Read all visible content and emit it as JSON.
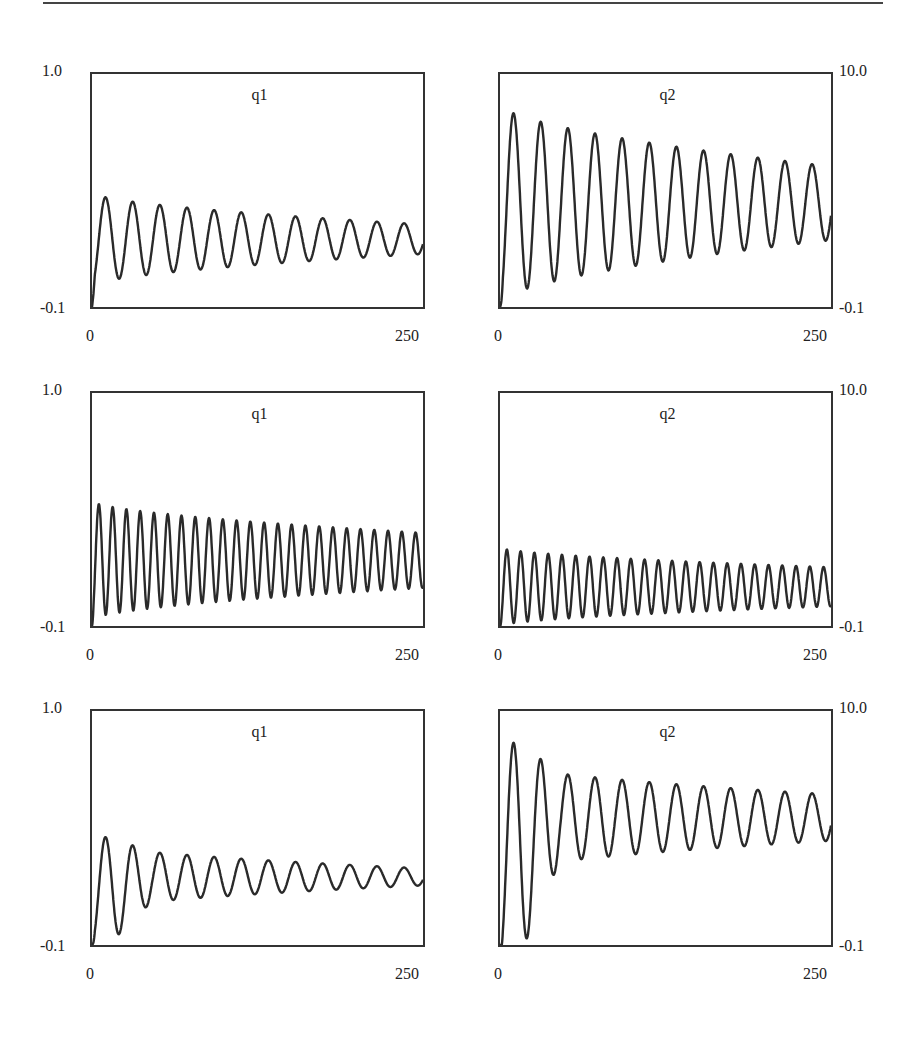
{
  "page": {
    "top_rule": true
  },
  "chart_data": [
    {
      "type": "line",
      "row": 1,
      "col": 1,
      "title": "q1",
      "xlim": [
        0,
        250
      ],
      "ylim": [
        -0.1,
        1.0
      ],
      "x_tick_labels": [
        "0",
        "250"
      ],
      "y_tick_labels": [
        "1.0",
        "-0.1"
      ],
      "y_axis_side": "left",
      "grid": false,
      "legend": null,
      "model": {
        "offset": 0.22,
        "amp0": 0.22,
        "amp_end": 0.07,
        "period": 20.5,
        "start": 0.0
      },
      "peaks": [
        0.26,
        0.24,
        0.23,
        0.22,
        0.21,
        0.2,
        0.19,
        0.18,
        0.17,
        0.17,
        0.16,
        0.15
      ],
      "troughs": [
        -0.03,
        -0.02,
        0.0,
        0.01,
        0.02,
        0.03,
        0.04,
        0.05,
        0.05,
        0.06,
        0.07,
        0.07
      ]
    },
    {
      "type": "line",
      "row": 1,
      "col": 2,
      "title": "q2",
      "xlim": [
        0,
        250
      ],
      "ylim": [
        -0.1,
        10.0
      ],
      "x_tick_labels": [
        "0",
        "250"
      ],
      "y_tick_labels": [
        "10.0",
        "-0.1"
      ],
      "y_axis_side": "right",
      "grid": false,
      "legend": null,
      "model": {
        "offset": 4.4,
        "amp0": 4.3,
        "amp_end": 1.6,
        "period": 20.5,
        "start": 0.0
      },
      "peaks": [
        8.2,
        7.8,
        7.4,
        7.1,
        6.9,
        6.6,
        6.4,
        6.2,
        6.0,
        5.9,
        5.7,
        5.6
      ],
      "troughs": [
        0.3,
        0.7,
        1.2,
        1.6,
        1.8,
        2.2,
        2.5,
        2.8,
        3.0,
        3.3,
        3.6,
        3.9
      ]
    },
    {
      "type": "line",
      "row": 2,
      "col": 1,
      "title": "q1",
      "xlim": [
        0,
        250
      ],
      "ylim": [
        -0.1,
        1.0
      ],
      "x_tick_labels": [
        "0",
        "250"
      ],
      "y_tick_labels": [
        "1.0",
        "-0.1"
      ],
      "y_axis_side": "left",
      "grid": false,
      "legend": null,
      "model": {
        "offset": 0.21,
        "amp0": 0.28,
        "amp_end": 0.13,
        "period": 10.4,
        "start": 0.0
      },
      "peaks": [
        0.45,
        0.49,
        0.45,
        0.4,
        0.42,
        0.44,
        0.42,
        0.37,
        0.35,
        0.36,
        0.38,
        0.36
      ],
      "troughs": [
        -0.03,
        -0.03,
        -0.02,
        -0.02,
        -0.01,
        0.0,
        0.0,
        0.01,
        0.01,
        0.02,
        0.02,
        0.03
      ]
    },
    {
      "type": "line",
      "row": 2,
      "col": 2,
      "title": "q2",
      "xlim": [
        0,
        250
      ],
      "ylim": [
        -0.1,
        10.0
      ],
      "x_tick_labels": [
        "0",
        "250"
      ],
      "y_tick_labels": [
        "10.0",
        "-0.1"
      ],
      "y_axis_side": "right",
      "grid": false,
      "legend": null,
      "model": {
        "offset": 1.6,
        "amp0": 1.7,
        "amp_end": 0.85,
        "period": 10.4,
        "start": 0.0
      },
      "peaks": [
        3.0,
        3.1,
        3.0,
        2.9,
        3.0,
        2.8,
        2.8,
        2.8,
        2.7,
        2.6,
        2.5,
        2.5
      ],
      "troughs": [
        0.1,
        0.2,
        0.3,
        0.4,
        0.5,
        0.6,
        0.7,
        0.8,
        0.9,
        0.9,
        1.0,
        1.0
      ]
    },
    {
      "type": "line",
      "row": 3,
      "col": 1,
      "title": "q1",
      "xlim": [
        0,
        250
      ],
      "ylim": [
        -0.1,
        1.0
      ],
      "x_tick_labels": [
        "0",
        "250"
      ],
      "y_tick_labels": [
        "1.0",
        "-0.1"
      ],
      "y_axis_side": "left",
      "grid": false,
      "legend": null,
      "model": {
        "offset": 0.22,
        "amp0": 0.16,
        "amp_end": 0.04,
        "period": 20.5,
        "start": 0.0,
        "transient_amp": 0.1,
        "transient_len": 45
      },
      "peaks": [
        0.3,
        0.28,
        0.27,
        0.26,
        0.25,
        0.24,
        0.23,
        0.22,
        0.22,
        0.21,
        0.21,
        0.2
      ],
      "troughs": [
        0.0,
        0.01,
        0.1,
        0.11,
        0.12,
        0.13,
        0.13,
        0.14,
        0.14,
        0.15,
        0.15,
        0.16
      ]
    },
    {
      "type": "line",
      "row": 3,
      "col": 2,
      "title": "q2",
      "xlim": [
        0,
        250
      ],
      "ylim": [
        -0.1,
        10.0
      ],
      "x_tick_labels": [
        "0",
        "250"
      ],
      "y_tick_labels": [
        "10.0",
        "-0.1"
      ],
      "y_axis_side": "right",
      "grid": false,
      "legend": null,
      "model": {
        "offset": 5.4,
        "amp0": 2.4,
        "amp_end": 1.0,
        "period": 20.5,
        "start": 0.0,
        "transient_amp": 2.3,
        "transient_len": 45
      },
      "peaks": [
        8.1,
        7.8,
        7.5,
        7.3,
        7.1,
        6.9,
        6.7,
        6.6,
        6.5,
        6.4,
        6.3,
        6.3
      ],
      "troughs": [
        0.6,
        0.9,
        3.0,
        3.4,
        3.7,
        4.0,
        4.3,
        4.4,
        4.5,
        4.6,
        4.8,
        4.9
      ]
    }
  ]
}
